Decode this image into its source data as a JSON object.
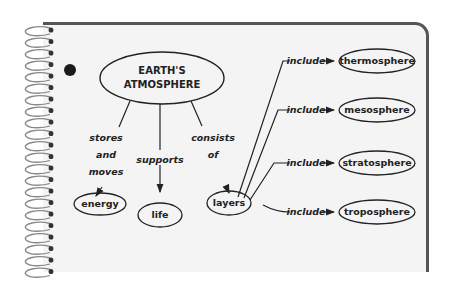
{
  "diagram": {
    "central_node": {
      "line1": "EARTH'S",
      "line2": "ATMOSPHERE"
    },
    "links": {
      "stores_and_moves": [
        "stores",
        "and",
        "moves"
      ],
      "supports": "supports",
      "consists_of": [
        "consists",
        "of"
      ],
      "include": "include"
    },
    "nodes": {
      "energy": "energy",
      "life": "life",
      "layers": "layers",
      "thermosphere": "thermosphere",
      "mesosphere": "mesosphere",
      "stratosphere": "stratosphere",
      "troposphere": "troposphere"
    },
    "colors": {
      "paper": "#f4f4f4",
      "ink": "#222222",
      "edge": "#555555"
    }
  }
}
